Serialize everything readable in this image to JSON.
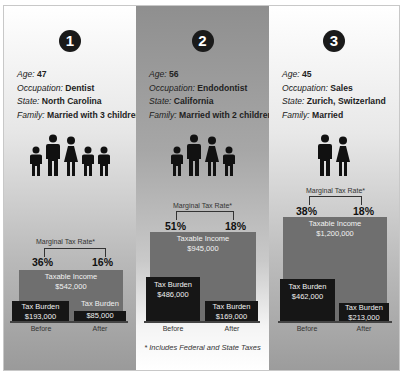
{
  "footnote": "* Includes Federal and State Taxes",
  "labels": {
    "age": "Age:",
    "occupation": "Occupation:",
    "state": "State:",
    "family": "Family:",
    "marginal_tax_rate": "Marginal Tax Rate*",
    "taxable_income": "Taxable Income",
    "tax_burden": "Tax Burden",
    "before": "Before",
    "after": "After"
  },
  "panels": [
    {
      "number": "1",
      "age": "47",
      "occupation": "Dentist",
      "state": "North Carolina",
      "family": "Married with 3 children",
      "people_icons": [
        "child-icon",
        "man-icon",
        "woman-icon",
        "child-icon",
        "child-icon"
      ],
      "marginal_before": "36%",
      "marginal_after": "16%",
      "taxable_income": "$542,000",
      "tax_burden_before": "$193,000",
      "tax_burden_after": "$85,000"
    },
    {
      "number": "2",
      "age": "56",
      "occupation": "Endodontist",
      "state": "California",
      "family": "Married with 2 children",
      "people_icons": [
        "child-icon",
        "man-icon",
        "woman-icon",
        "child-icon"
      ],
      "marginal_before": "51%",
      "marginal_after": "18%",
      "taxable_income": "$945,000",
      "tax_burden_before": "$486,000",
      "tax_burden_after": "$169,000"
    },
    {
      "number": "3",
      "age": "45",
      "occupation": "Sales",
      "state": "Zurich, Switzerland",
      "family": "Married",
      "people_icons": [
        "man-icon",
        "woman-icon"
      ],
      "marginal_before": "38%",
      "marginal_after": "18%",
      "taxable_income": "$1,200,000",
      "tax_burden_before": "$462,000",
      "tax_burden_after": "$213,000"
    }
  ],
  "colors": {
    "income_bar": "#6f6f6f",
    "burden_bar": "#161616",
    "badge": "#1a1a1a"
  }
}
